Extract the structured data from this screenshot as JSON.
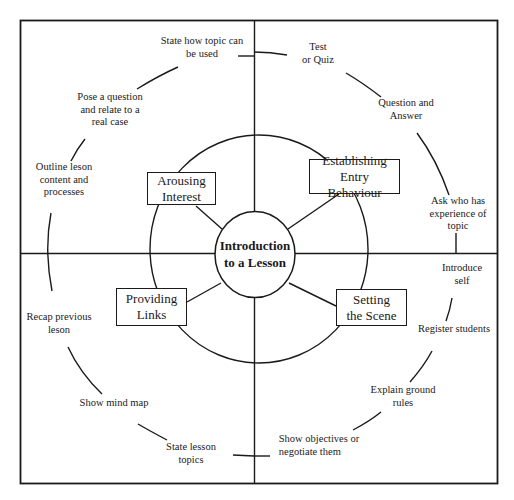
{
  "diagram": {
    "title": "Introduction to a Lesson",
    "title_lines": [
      "Introduction",
      "to a Lesson"
    ],
    "stages": [
      {
        "id": "arousing-interest",
        "lines": [
          "Arousing",
          "Interest"
        ],
        "quadrant": "top-left"
      },
      {
        "id": "establishing-entry-behaviour",
        "lines": [
          "Establishing",
          "Entry Behaviour"
        ],
        "quadrant": "top-right"
      },
      {
        "id": "providing-links",
        "lines": [
          "Providing",
          "Links"
        ],
        "quadrant": "bottom-left"
      },
      {
        "id": "setting-the-scene",
        "lines": [
          "Setting",
          "the Scene"
        ],
        "quadrant": "bottom-right"
      }
    ],
    "activities": {
      "top_left": [
        {
          "lines": [
            "State how topic can",
            "be used"
          ]
        },
        {
          "lines": [
            "Pose a question",
            "and relate to a",
            "real case"
          ]
        },
        {
          "lines": [
            "Outline leson",
            "content and",
            "processes"
          ]
        }
      ],
      "top_right": [
        {
          "lines": [
            "Test",
            "or Quiz"
          ]
        },
        {
          "lines": [
            "Question and",
            "Answer"
          ]
        },
        {
          "lines": [
            "Ask who has",
            "experience of",
            "topic"
          ]
        }
      ],
      "bottom_right": [
        {
          "lines": [
            "Introduce",
            "self"
          ]
        },
        {
          "lines": [
            "Register students"
          ]
        },
        {
          "lines": [
            "Explain ground",
            "rules"
          ]
        },
        {
          "lines": [
            "Show objectives or",
            "negotiate them"
          ]
        }
      ],
      "bottom_left": [
        {
          "lines": [
            "Recap previous",
            "leson"
          ]
        },
        {
          "lines": [
            "Show mind map"
          ]
        },
        {
          "lines": [
            "State lesson",
            "topics"
          ]
        }
      ]
    },
    "colors": {
      "line": "#1a1a1a",
      "background": "#ffffff"
    }
  }
}
